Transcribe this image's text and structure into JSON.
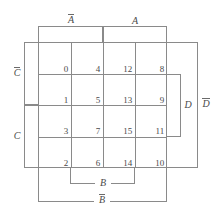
{
  "diagram": {
    "type": "karnaugh-map",
    "rows": 4,
    "cols": 4,
    "line_color": "#8a8a8a",
    "text_color": "#4a4a4a",
    "background": "#ffffff"
  },
  "cells": [
    {
      "row": 0,
      "col": 0,
      "minterm": "0"
    },
    {
      "row": 0,
      "col": 1,
      "minterm": "4"
    },
    {
      "row": 0,
      "col": 2,
      "minterm": "12"
    },
    {
      "row": 0,
      "col": 3,
      "minterm": "8"
    },
    {
      "row": 1,
      "col": 0,
      "minterm": "1"
    },
    {
      "row": 1,
      "col": 1,
      "minterm": "5"
    },
    {
      "row": 1,
      "col": 2,
      "minterm": "13"
    },
    {
      "row": 1,
      "col": 3,
      "minterm": "9"
    },
    {
      "row": 2,
      "col": 0,
      "minterm": "3"
    },
    {
      "row": 2,
      "col": 1,
      "minterm": "7"
    },
    {
      "row": 2,
      "col": 2,
      "minterm": "15"
    },
    {
      "row": 2,
      "col": 3,
      "minterm": "11"
    },
    {
      "row": 3,
      "col": 0,
      "minterm": "2"
    },
    {
      "row": 3,
      "col": 1,
      "minterm": "6"
    },
    {
      "row": 3,
      "col": 2,
      "minterm": "14"
    },
    {
      "row": 3,
      "col": 3,
      "minterm": "10"
    }
  ],
  "labels": {
    "top_left": {
      "text": "A",
      "overbar": true,
      "spans": "columns 1-2"
    },
    "top_right": {
      "text": "A",
      "overbar": false,
      "spans": "columns 3-4"
    },
    "left_upper": {
      "text": "C",
      "overbar": true,
      "spans": "rows 1-2"
    },
    "left_lower": {
      "text": "C",
      "overbar": false,
      "spans": "rows 3-4"
    },
    "right_inner": {
      "text": "D",
      "overbar": false,
      "spans": "rows 2-3"
    },
    "right_outer": {
      "text": "D",
      "overbar": true,
      "spans": "rows 1-4"
    },
    "bottom_inner": {
      "text": "B",
      "overbar": false,
      "spans": "columns 2-3"
    },
    "bottom_outer": {
      "text": "B",
      "overbar": true,
      "spans": "columns 1-4"
    }
  }
}
